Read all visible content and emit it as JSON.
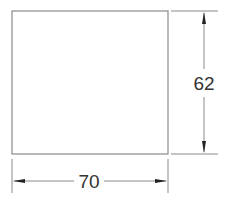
{
  "diagram": {
    "shape": "rectangle",
    "dimensions": {
      "width_label": "70",
      "height_label": "62"
    },
    "colors": {
      "line": "#8a8a8a",
      "arrow": "#222222",
      "text": "#333333"
    }
  }
}
